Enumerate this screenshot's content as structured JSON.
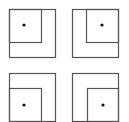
{
  "diagram": {
    "type": "nested-squares",
    "stroke_color": "#555555",
    "dot_color": "#111111",
    "panels": [
      {
        "position": "top-left",
        "outer": {
          "x": 9,
          "y": 9,
          "w": 46,
          "h": 48
        },
        "inner": {
          "x": 9,
          "y": 9,
          "w": 32,
          "h": 33
        },
        "inner_corner": "top-left",
        "dot": {
          "x": 24,
          "y": 25
        }
      },
      {
        "position": "top-right",
        "outer": {
          "x": 72,
          "y": 9,
          "w": 46,
          "h": 48
        },
        "inner": {
          "x": 86,
          "y": 9,
          "w": 32,
          "h": 33
        },
        "inner_corner": "top-right",
        "dot": {
          "x": 102,
          "y": 25
        }
      },
      {
        "position": "bottom-left",
        "outer": {
          "x": 9,
          "y": 73,
          "w": 46,
          "h": 48
        },
        "inner": {
          "x": 9,
          "y": 88,
          "w": 32,
          "h": 33
        },
        "inner_corner": "bottom-left",
        "dot": {
          "x": 24,
          "y": 105
        }
      },
      {
        "position": "bottom-right",
        "outer": {
          "x": 72,
          "y": 73,
          "w": 46,
          "h": 48
        },
        "inner": {
          "x": 87,
          "y": 88,
          "w": 31,
          "h": 33
        },
        "inner_corner": "bottom-right",
        "dot": {
          "x": 103,
          "y": 105
        }
      }
    ]
  }
}
